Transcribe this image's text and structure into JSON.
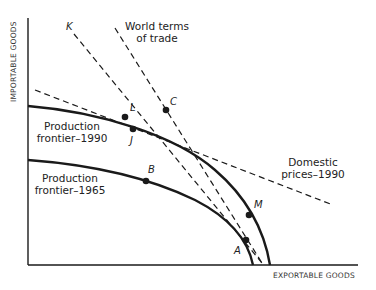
{
  "axes": {
    "x_label": "EXPORTABLE GOODS",
    "y_label": "IMPORTABLE GOODS"
  },
  "curves": {
    "frontier_1990": {
      "label_line1": "Production",
      "label_line2": "frontier–1990"
    },
    "frontier_1965": {
      "label_line1": "Production",
      "label_line2": "frontier–1965"
    }
  },
  "lines": {
    "world_terms": {
      "label_line1": "World terms",
      "label_line2": "of trade"
    },
    "domestic_prices": {
      "label_line1": "Domestic",
      "label_line2": "prices–1990"
    },
    "k_line": {
      "label": "K"
    }
  },
  "points": {
    "L": "L",
    "C": "C",
    "J": "J",
    "B": "B",
    "M": "M",
    "A": "A"
  },
  "colors": {
    "ink": "#1a1a1a",
    "background": "#ffffff"
  }
}
